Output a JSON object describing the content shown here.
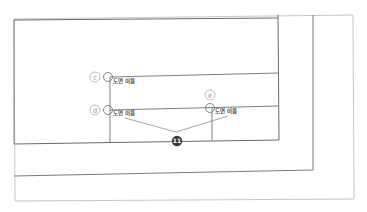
{
  "diagram": {
    "labels": {
      "c": {
        "callout": "c",
        "text": "도면 이름"
      },
      "d": {
        "callout": "d",
        "text": "도면 이름"
      },
      "e": {
        "callout": "e",
        "text": "도면 이름"
      }
    },
    "badge": {
      "text": "11"
    },
    "colors": {
      "line": "#6f6f6f",
      "outer_frame": "#c8c8c8",
      "callout": "#aaaaaa",
      "badge": "#3a3a3a"
    }
  }
}
